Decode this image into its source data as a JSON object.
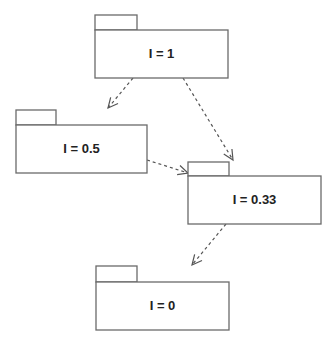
{
  "diagram": {
    "type": "uml-package-dependency",
    "colors": {
      "stroke": "#6a6a6a",
      "text": "#222222",
      "background": "#ffffff",
      "arrow": "#555555"
    },
    "packages": [
      {
        "id": "p1",
        "label": "I = 1",
        "tab": {
          "x": 95,
          "y": 15,
          "w": 42,
          "h": 15
        },
        "body": {
          "x": 95,
          "y": 30,
          "w": 133,
          "h": 48
        }
      },
      {
        "id": "p2",
        "label": "I = 0.5",
        "tab": {
          "x": 16,
          "y": 110,
          "w": 40,
          "h": 15
        },
        "body": {
          "x": 16,
          "y": 125,
          "w": 131,
          "h": 48
        }
      },
      {
        "id": "p3",
        "label": "I = 0.33",
        "tab": {
          "x": 188,
          "y": 162,
          "w": 41,
          "h": 14
        },
        "body": {
          "x": 188,
          "y": 176,
          "w": 133,
          "h": 48
        }
      },
      {
        "id": "p4",
        "label": "I = 0",
        "tab": {
          "x": 96,
          "y": 266,
          "w": 41,
          "h": 16
        },
        "body": {
          "x": 96,
          "y": 282,
          "w": 133,
          "h": 48
        }
      }
    ],
    "dependencies": [
      {
        "from": "p1",
        "to": "p2",
        "x1": 133,
        "y1": 78,
        "x2": 108,
        "y2": 108
      },
      {
        "from": "p1",
        "to": "p3",
        "x1": 183,
        "y1": 78,
        "x2": 233,
        "y2": 160
      },
      {
        "from": "p2",
        "to": "p3",
        "x1": 147,
        "y1": 160,
        "x2": 188,
        "y2": 173
      },
      {
        "from": "p3",
        "to": "p4",
        "x1": 226,
        "y1": 224,
        "x2": 192,
        "y2": 265
      }
    ]
  }
}
